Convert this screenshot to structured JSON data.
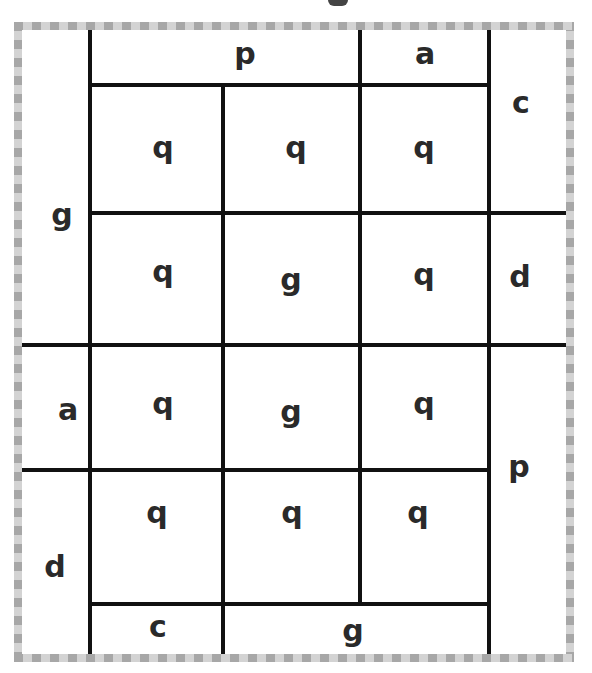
{
  "diagram": {
    "type": "letter-grid-puzzle",
    "border_style": "dashed-gray",
    "colors": {
      "border_dark": "#a7a7a7",
      "border_light": "#d3d3d3",
      "line": "#111111",
      "text": "#2a2a2a"
    },
    "cells": [
      {
        "id": "top-p",
        "letter": "p"
      },
      {
        "id": "top-a",
        "letter": "a"
      },
      {
        "id": "right-c",
        "letter": "c"
      },
      {
        "id": "left-g",
        "letter": "g"
      },
      {
        "id": "r1c1",
        "letter": "q"
      },
      {
        "id": "r1c2",
        "letter": "q"
      },
      {
        "id": "r1c3",
        "letter": "q"
      },
      {
        "id": "r2c1",
        "letter": "q"
      },
      {
        "id": "r2c2",
        "letter": "g"
      },
      {
        "id": "r2c3",
        "letter": "q"
      },
      {
        "id": "right-d",
        "letter": "d"
      },
      {
        "id": "left-a",
        "letter": "a"
      },
      {
        "id": "r3c1",
        "letter": "q"
      },
      {
        "id": "r3c2",
        "letter": "g"
      },
      {
        "id": "r3c3",
        "letter": "q"
      },
      {
        "id": "right-p",
        "letter": "p"
      },
      {
        "id": "left-d",
        "letter": "d"
      },
      {
        "id": "r4c1",
        "letter": "q"
      },
      {
        "id": "r4c2",
        "letter": "q"
      },
      {
        "id": "r4c3",
        "letter": "q"
      },
      {
        "id": "bottom-c",
        "letter": "c"
      },
      {
        "id": "bottom-g",
        "letter": "g"
      }
    ]
  }
}
